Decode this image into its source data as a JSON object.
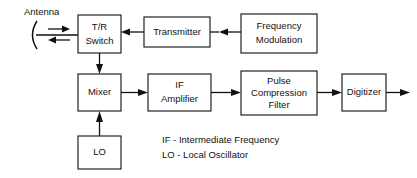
{
  "diagram": {
    "type": "block-diagram",
    "background_color": "#ffffff",
    "line_color": "#111111",
    "text_color": "#111111",
    "antenna": {
      "label": "Antenna",
      "transmit_direction": "right",
      "receive_direction": "left"
    },
    "blocks": [
      {
        "id": "tr-switch",
        "lines": [
          "T/R",
          "Switch"
        ]
      },
      {
        "id": "transmitter",
        "lines": [
          "Transmitter"
        ]
      },
      {
        "id": "frequency-modulation",
        "lines": [
          "Frequency",
          "Modulation"
        ]
      },
      {
        "id": "mixer",
        "lines": [
          "Mixer"
        ]
      },
      {
        "id": "if-amplifier",
        "lines": [
          "IF",
          "Amplifier"
        ]
      },
      {
        "id": "pulse-compression-filter",
        "lines": [
          "Pulse",
          "Compression",
          "Filter"
        ]
      },
      {
        "id": "digitizer",
        "lines": [
          "Digitizer"
        ]
      },
      {
        "id": "lo",
        "lines": [
          "LO"
        ]
      }
    ],
    "connections": [
      {
        "from": "antenna",
        "to": "tr-switch",
        "direction": "right"
      },
      {
        "from": "tr-switch",
        "to": "antenna",
        "direction": "left"
      },
      {
        "from": "transmitter",
        "to": "tr-switch",
        "direction": "left"
      },
      {
        "from": "frequency-modulation",
        "to": "transmitter",
        "direction": "left"
      },
      {
        "from": "tr-switch",
        "to": "mixer",
        "direction": "down"
      },
      {
        "from": "lo",
        "to": "mixer",
        "direction": "up"
      },
      {
        "from": "mixer",
        "to": "if-amplifier",
        "direction": "right"
      },
      {
        "from": "if-amplifier",
        "to": "pulse-compression-filter",
        "direction": "right"
      },
      {
        "from": "pulse-compression-filter",
        "to": "digitizer",
        "direction": "right"
      },
      {
        "from": "digitizer",
        "to": "output",
        "direction": "right"
      }
    ],
    "legend": [
      "IF - Intermediate Frequency",
      "LO - Local Oscillator"
    ]
  }
}
